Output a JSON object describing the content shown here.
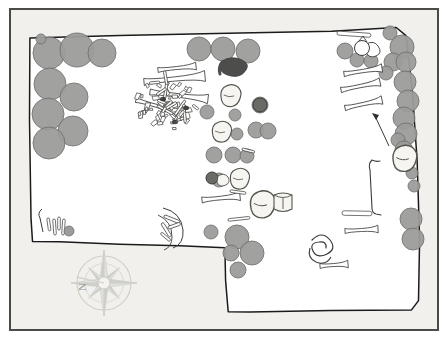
{
  "document": {
    "type": "archaeological-site-plan",
    "title": "",
    "caption": "",
    "background_color": "#f1f0ec",
    "frame_color": "#4a4a48",
    "excavation_fill": "#ffffff",
    "excavation_outline_color": "#1b1b1b",
    "stone_fill": "#9c9c9a",
    "stone_stroke": "#6f6f6d",
    "bone_fill": "#ffffff",
    "bone_stroke": "#3a3a38",
    "dark_artifact_fill": "#4d4d4b",
    "vessel_fill": "#f6f5f1",
    "vessel_stroke": "#55554f"
  },
  "compass": {
    "label": "N",
    "name": "compass-rose",
    "center_x": 104,
    "center_y": 283,
    "radius": 27,
    "points": 8,
    "color": "#cfcfca",
    "label_x": 78,
    "label_y": 281
  },
  "trench": {
    "name": "excavation-outline",
    "description": "L-shaped / notched trench boundary",
    "outline_points": [
      [
        31,
        217
      ],
      [
        30,
        38
      ],
      [
        120,
        35
      ],
      [
        332,
        32
      ],
      [
        397,
        29
      ],
      [
        408,
        37
      ],
      [
        416,
        120
      ],
      [
        420,
        240
      ],
      [
        418,
        305
      ],
      [
        410,
        311
      ],
      [
        228,
        312
      ],
      [
        224,
        265
      ],
      [
        225,
        247
      ],
      [
        205,
        245
      ],
      [
        120,
        243
      ],
      [
        34,
        241
      ]
    ],
    "notch_points": [
      [
        31,
        240
      ],
      [
        205,
        244
      ],
      [
        224,
        264
      ],
      [
        225,
        312
      ]
    ]
  },
  "features": {
    "stone_clusters": [
      {
        "name": "northwest-stone-cluster",
        "count": 9,
        "circles": [
          {
            "cx": 49,
            "cy": 53,
            "r": 16
          },
          {
            "cx": 77,
            "cy": 50,
            "r": 17
          },
          {
            "cx": 102,
            "cy": 53,
            "r": 14
          },
          {
            "cx": 50,
            "cy": 84,
            "r": 16
          },
          {
            "cx": 74,
            "cy": 97,
            "r": 14
          },
          {
            "cx": 48,
            "cy": 114,
            "r": 16
          },
          {
            "cx": 73,
            "cy": 131,
            "r": 15
          },
          {
            "cx": 49,
            "cy": 143,
            "r": 16
          },
          {
            "cx": 41,
            "cy": 39,
            "r": 5
          }
        ]
      },
      {
        "name": "north-central-stones",
        "count": 3,
        "circles": [
          {
            "cx": 199,
            "cy": 49,
            "r": 12
          },
          {
            "cx": 223,
            "cy": 49,
            "r": 12
          },
          {
            "cx": 248,
            "cy": 51,
            "r": 12
          }
        ]
      },
      {
        "name": "east-edge-stone-column",
        "count": 16,
        "circles": [
          {
            "cx": 390,
            "cy": 33,
            "r": 7
          },
          {
            "cx": 345,
            "cy": 51,
            "r": 8
          },
          {
            "cx": 402,
            "cy": 47,
            "r": 12
          },
          {
            "cx": 357,
            "cy": 60,
            "r": 7
          },
          {
            "cx": 371,
            "cy": 61,
            "r": 7
          },
          {
            "cx": 393,
            "cy": 62,
            "r": 9
          },
          {
            "cx": 406,
            "cy": 62,
            "r": 10
          },
          {
            "cx": 386,
            "cy": 73,
            "r": 7
          },
          {
            "cx": 405,
            "cy": 82,
            "r": 11
          },
          {
            "cx": 408,
            "cy": 101,
            "r": 11
          },
          {
            "cx": 404,
            "cy": 118,
            "r": 11
          },
          {
            "cx": 406,
            "cy": 134,
            "r": 11
          },
          {
            "cx": 398,
            "cy": 140,
            "r": 7
          },
          {
            "cx": 404,
            "cy": 150,
            "r": 9
          },
          {
            "cx": 412,
            "cy": 173,
            "r": 6
          },
          {
            "cx": 414,
            "cy": 186,
            "r": 6
          },
          {
            "cx": 411,
            "cy": 219,
            "r": 11
          },
          {
            "cx": 413,
            "cy": 239,
            "r": 11
          }
        ]
      },
      {
        "name": "central-small-stones",
        "count": 12,
        "circles": [
          {
            "cx": 207,
            "cy": 112,
            "r": 7
          },
          {
            "cx": 235,
            "cy": 115,
            "r": 6
          },
          {
            "cx": 260,
            "cy": 105,
            "r": 8
          },
          {
            "cx": 237,
            "cy": 134,
            "r": 6
          },
          {
            "cx": 256,
            "cy": 130,
            "r": 8
          },
          {
            "cx": 268,
            "cy": 131,
            "r": 8
          },
          {
            "cx": 214,
            "cy": 155,
            "r": 8
          },
          {
            "cx": 233,
            "cy": 155,
            "r": 8
          },
          {
            "cx": 247,
            "cy": 156,
            "r": 7
          },
          {
            "cx": 219,
            "cy": 180,
            "r": 7
          },
          {
            "cx": 211,
            "cy": 232,
            "r": 7
          }
        ]
      },
      {
        "name": "south-central-stone-cluster",
        "count": 5,
        "circles": [
          {
            "cx": 237,
            "cy": 237,
            "r": 12
          },
          {
            "cx": 231,
            "cy": 253,
            "r": 8
          },
          {
            "cx": 252,
            "cy": 253,
            "r": 12
          },
          {
            "cx": 238,
            "cy": 270,
            "r": 8
          }
        ]
      }
    ],
    "bone_clusters": [
      {
        "name": "central-bone-midden",
        "cx": 170,
        "cy": 105,
        "description": "dense overlapping faunal bone scatter"
      },
      {
        "name": "southwest-bone-fragments",
        "cx": 55,
        "cy": 226,
        "description": "small vertical bone shafts"
      },
      {
        "name": "long-bone-group-east",
        "count": 3,
        "description": "three parallel limb bones"
      },
      {
        "name": "spiral-artifact",
        "cx": 322,
        "cy": 246,
        "description": "coiled shell or antler"
      },
      {
        "name": "curved-bone-group-center",
        "cx": 175,
        "cy": 222,
        "description": "curved ribs with arc"
      }
    ],
    "vessels": [
      {
        "name": "vessel-north",
        "cx": 231,
        "cy": 97,
        "type": "sherd"
      },
      {
        "name": "vessel-mid",
        "cx": 222,
        "cy": 133,
        "type": "jar"
      },
      {
        "name": "vessel-lower",
        "cx": 240,
        "cy": 180,
        "type": "sherd"
      },
      {
        "name": "vessel-pot-south",
        "cx": 263,
        "cy": 206,
        "type": "vessel"
      },
      {
        "name": "vessel-cylinder-south",
        "cx": 283,
        "cy": 203,
        "type": "cylindrical-pot"
      },
      {
        "name": "vessel-east-edge",
        "cx": 405,
        "cy": 160,
        "type": "vessel"
      },
      {
        "name": "vessel-northeast",
        "cx": 363,
        "cy": 48,
        "type": "ring"
      }
    ],
    "dark_artifacts": [
      {
        "name": "dark-stone-north",
        "cx": 234,
        "cy": 67
      }
    ]
  }
}
